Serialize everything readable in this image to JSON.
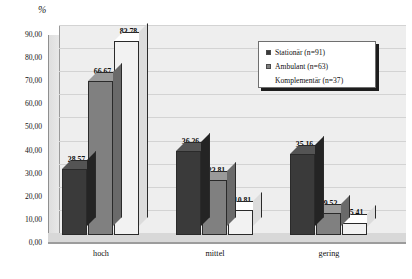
{
  "chart_data": {
    "type": "bar",
    "title": "",
    "subtitle": "",
    "xlabel": "",
    "ylabel": "%",
    "categories": [
      "hoch",
      "mittel",
      "gering"
    ],
    "series": [
      {
        "name": "Stationär (n=91)",
        "values": [
          28.57,
          36.26,
          35.16
        ],
        "color": "#3a3a3a"
      },
      {
        "name": "Ambulant (n=63)",
        "values": [
          66.67,
          23.81,
          9.52
        ],
        "color": "#808080"
      },
      {
        "name": "Komplementär (n=37)",
        "values": [
          83.78,
          10.81,
          5.41
        ],
        "color": "#f2f2f2"
      }
    ],
    "value_labels": [
      [
        "28,57",
        "66,67",
        "83,78"
      ],
      [
        "36,26",
        "23,81",
        "10,81"
      ],
      [
        "35,16",
        "9,52",
        "5,41"
      ]
    ],
    "ylim": [
      0,
      90
    ],
    "ytick_labels": [
      "0,00",
      "10,00",
      "20,00",
      "30,00",
      "40,00",
      "50,00",
      "60,00",
      "70,00",
      "80,00",
      "90,00"
    ],
    "ytick_values": [
      0,
      10,
      20,
      30,
      40,
      50,
      60,
      70,
      80,
      90
    ],
    "grid": true,
    "legend_position": "top-right",
    "three_d": true
  },
  "legend": {
    "items": [
      {
        "label": "Stationär (n=91)",
        "color": "#3a3a3a"
      },
      {
        "label": "Ambulant (n=63)",
        "color": "#808080"
      },
      {
        "label": "Komplementär (n=37)",
        "color": "#f2f2f2"
      }
    ]
  },
  "colors": {
    "series_1": "#3a3a3a",
    "series_2": "#808080",
    "series_3": "#f2f2f2",
    "plot_background": "#eeeeee",
    "gridline": "#d3d3d3",
    "text": "#111111"
  }
}
